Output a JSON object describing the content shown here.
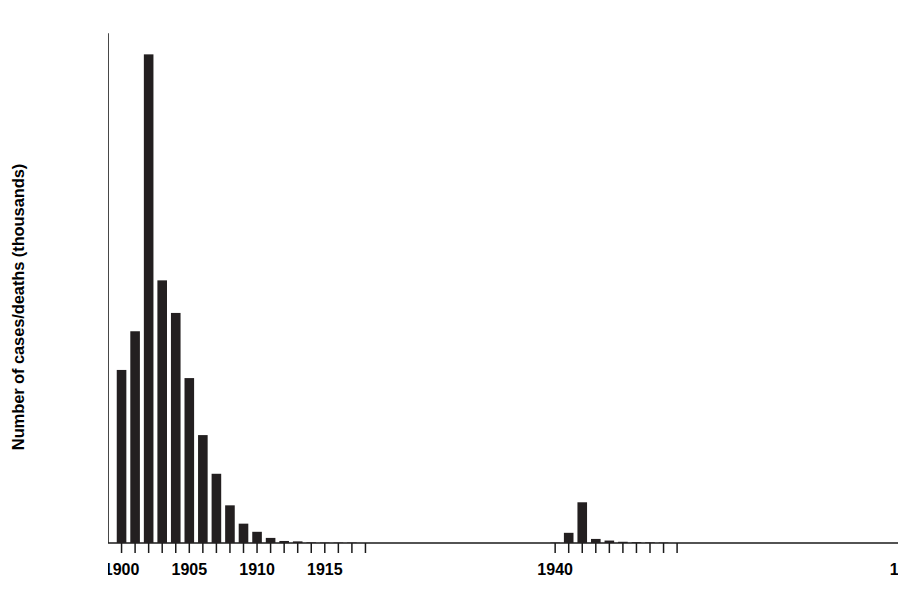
{
  "chart_data": {
    "type": "bar",
    "title": "",
    "subtitle": "",
    "xlabel": "",
    "ylabel": "Number of cases/deaths (thousands)",
    "ylim": [
      0,
      25
    ],
    "yticks": [
      0,
      5,
      10,
      15,
      20,
      25
    ],
    "ytick_labels": [
      "0",
      "5",
      "10",
      "15",
      "20",
      "25"
    ],
    "grid": false,
    "legend": null,
    "axis_break": true,
    "axis_break_note": "x-axis has two breaks: between 1917 and 1940, and between 1948 and 1976",
    "segments": [
      {
        "name": "1900-1917",
        "categories": [
          1900,
          1901,
          1902,
          1903,
          1904,
          1905,
          1906,
          1907,
          1908,
          1909,
          1910,
          1911,
          1912,
          1913,
          1914,
          1915,
          1916,
          1917
        ],
        "values": [
          8.5,
          10.4,
          24.0,
          12.9,
          11.3,
          8.1,
          5.3,
          3.4,
          1.85,
          0.95,
          0.55,
          0.25,
          0.1,
          0.08,
          0.03,
          0.02,
          0.02,
          0.02
        ],
        "tick_labels": [
          {
            "year": 1900,
            "label": "1900"
          },
          {
            "year": 1905,
            "label": "1905"
          },
          {
            "year": 1910,
            "label": "1910"
          },
          {
            "year": 1915,
            "label": "1915"
          }
        ]
      },
      {
        "name": "1940-1948",
        "categories": [
          1940,
          1941,
          1942,
          1943,
          1944,
          1945,
          1946,
          1947,
          1948
        ],
        "values": [
          0.02,
          0.5,
          2.0,
          0.2,
          0.12,
          0.06,
          0.04,
          0.03,
          0.02
        ],
        "tick_labels": [
          {
            "year": 1940,
            "label": "1940"
          }
        ]
      },
      {
        "name": "1976-1992",
        "categories": [
          1976,
          1977,
          1978,
          1979,
          1980,
          1981,
          1982,
          1983,
          1984,
          1985,
          1986,
          1987,
          1988,
          1989,
          1990,
          1991,
          1992
        ],
        "values": [
          0.05,
          0.6,
          2.1,
          5.0,
          8.4,
          1.95,
          1.4,
          1.35,
          2.0,
          3.5,
          4.45,
          6.7,
          2.7,
          0.6,
          0.4,
          0.25,
          0.25
        ],
        "tick_labels": [
          {
            "year": 1976,
            "label": "1976"
          },
          {
            "year": 1980,
            "label": "1980"
          },
          {
            "year": 1985,
            "label": "1985"
          },
          {
            "year": 1989,
            "label": "1989"
          },
          {
            "year": 1992,
            "label": "1992"
          }
        ]
      }
    ],
    "colors": {
      "bar": "#231f20",
      "axis": "#1a1a1a",
      "background": "#ffffff"
    }
  }
}
